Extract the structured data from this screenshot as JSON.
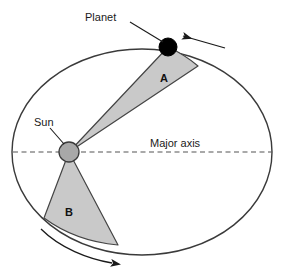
{
  "diagram": {
    "labels": {
      "planet": "Planet",
      "sun": "Sun",
      "major_axis": "Major axis",
      "sector_a": "A",
      "sector_b": "B"
    },
    "colors": {
      "background": "#ffffff",
      "orbit_stroke": "#3a3a3a",
      "sector_fill": "#c9c9c9",
      "sector_stroke": "#444444",
      "sun_fill": "#a8a8a8",
      "sun_stroke": "#3a3a3a",
      "planet_fill": "#000000",
      "axis_dash": "#555555",
      "text": "#1a1a1a"
    },
    "geometry": {
      "ellipse_center_x": 142,
      "ellipse_center_y": 152,
      "ellipse_rx": 130,
      "ellipse_ry": 103,
      "sun_x": 69,
      "sun_y": 152,
      "sun_r": 10,
      "planet_x": 168,
      "planet_y": 47,
      "planet_r": 9,
      "major_axis_y": 152,
      "major_axis_x1": 13,
      "major_axis_x2": 272
    },
    "annotations": {
      "planet_leader_from_x": 130,
      "planet_leader_from_y": 22,
      "planet_leader_to_x": 162,
      "planet_leader_to_y": 42,
      "motion_arrow_top": "left-pointing-arrow",
      "motion_arrow_bottom": "right-pointing-curved-arrow"
    }
  }
}
